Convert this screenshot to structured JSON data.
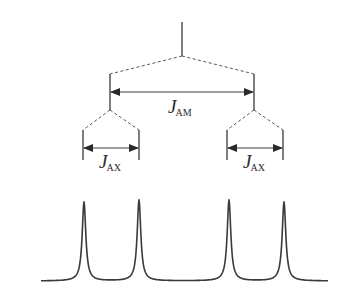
{
  "diagram": {
    "title": "",
    "colors": {
      "line": "#3a3a3a",
      "background": "#ffffff"
    },
    "root": {
      "x": 182,
      "y_top": 22,
      "y_bottom": 56
    },
    "level1": {
      "branches": [
        {
          "x": 110,
          "y_top": 74,
          "y_bottom": 110
        },
        {
          "x": 254,
          "y_top": 74,
          "y_bottom": 110
        }
      ],
      "arrow_y": 92,
      "label": {
        "symbol": "J",
        "subscript": "AM"
      }
    },
    "level2": {
      "groups": [
        {
          "left_x": 83,
          "right_x": 139,
          "y_top": 130,
          "y_bottom": 160,
          "parent_x": 110
        },
        {
          "left_x": 227,
          "right_x": 283,
          "y_top": 130,
          "y_bottom": 160,
          "parent_x": 254
        }
      ],
      "arrow_y": 148,
      "labels": [
        {
          "symbol": "J",
          "subscript": "AX"
        },
        {
          "symbol": "J",
          "subscript": "AX"
        }
      ]
    },
    "spectrum": {
      "baseline_y": 277,
      "x_start": 41,
      "x_end": 328,
      "peaks": [
        {
          "x": 84,
          "top_y": 202
        },
        {
          "x": 139,
          "top_y": 200
        },
        {
          "x": 229,
          "top_y": 200
        },
        {
          "x": 284,
          "top_y": 202
        }
      ]
    }
  }
}
